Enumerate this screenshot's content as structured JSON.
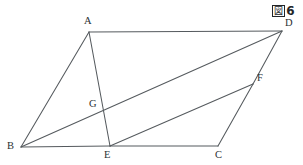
{
  "figure": {
    "caption_mark": "図",
    "caption_number": "6",
    "caption_full": "図6",
    "background_color": "#ffffff",
    "line_color": "#555a5e",
    "label_color": "#2b2f33"
  },
  "geometry": {
    "type": "parallelogram-with-cevians",
    "viewbox": "0 0 303 165",
    "points": {
      "A": {
        "x": 89,
        "y": 32,
        "label": "A",
        "label_x": 84,
        "label_y": 16
      },
      "B": {
        "x": 21,
        "y": 147,
        "label": "B",
        "label_x": 7,
        "label_y": 141
      },
      "C": {
        "x": 218,
        "y": 146,
        "label": "C",
        "label_x": 215,
        "label_y": 150
      },
      "D": {
        "x": 282,
        "y": 31,
        "label": "D",
        "label_x": 285,
        "label_y": 18
      },
      "E": {
        "x": 110,
        "y": 146,
        "label": "E",
        "label_x": 104,
        "label_y": 150
      },
      "F": {
        "x": 253,
        "y": 84,
        "label": "F",
        "label_x": 257,
        "label_y": 73
      },
      "G": {
        "x": 103,
        "y": 107,
        "label": "G",
        "label_x": 89,
        "label_y": 99
      }
    },
    "segments": [
      {
        "name": "AD",
        "from": "A",
        "to": "D"
      },
      {
        "name": "AB",
        "from": "A",
        "to": "B"
      },
      {
        "name": "AE",
        "from": "A",
        "to": "E"
      },
      {
        "name": "BE",
        "from": "B",
        "to": "E"
      },
      {
        "name": "BD",
        "from": "B",
        "to": "D"
      },
      {
        "name": "EC",
        "from": "E",
        "to": "C"
      },
      {
        "name": "EF",
        "from": "E",
        "to": "F"
      },
      {
        "name": "FC",
        "from": "F",
        "to": "C"
      },
      {
        "name": "FD",
        "from": "F",
        "to": "D"
      }
    ]
  }
}
